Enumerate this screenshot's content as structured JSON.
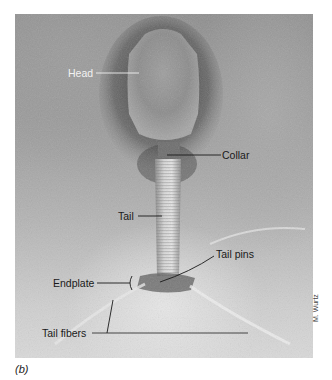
{
  "figure": {
    "caption": "(b)",
    "credit": "M. Wurtz"
  },
  "labels": {
    "head": "Head",
    "collar": "Collar",
    "tail": "Tail",
    "tail_pins": "Tail pins",
    "endplate": "Endplate",
    "tail_fibers": "Tail fibers"
  },
  "colors": {
    "label_light": "#f2f2f2",
    "label_dark": "#1a1a1a",
    "background": "#ffffff"
  }
}
